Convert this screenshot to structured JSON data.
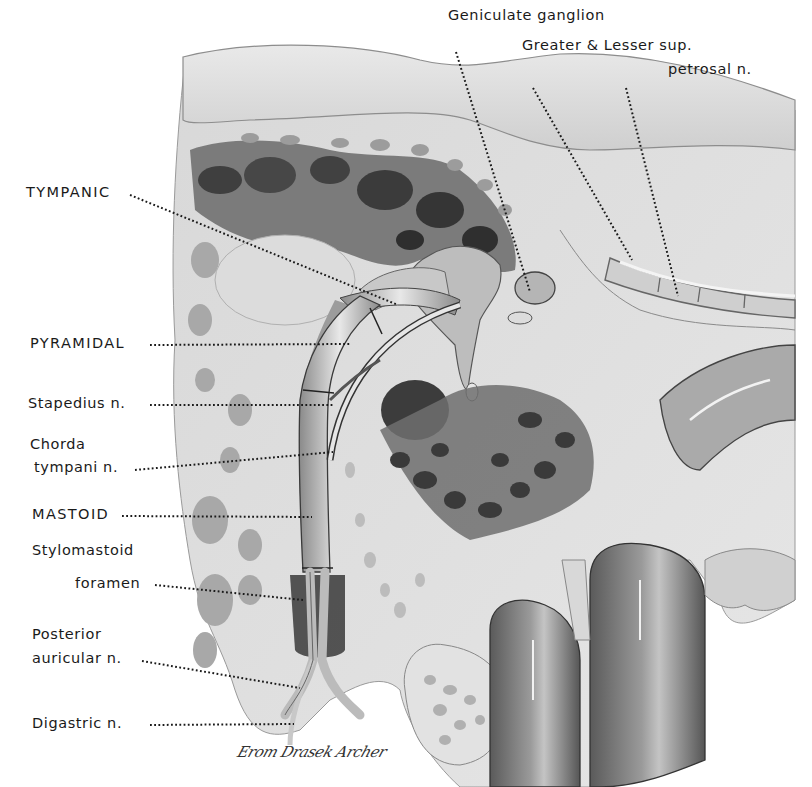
{
  "figure": {
    "type": "anatomical-illustration",
    "colors": {
      "background": "#ffffff",
      "ink": "#1a1a1a",
      "bone_light": "#e4e4e4",
      "bone_mid": "#bdbdbd",
      "cavity_dark": "#5a5a5a",
      "nerve": "#d6d6d6"
    }
  },
  "labels": {
    "geniculate": "Geniculate ganglion",
    "greater_lesser_1": "Greater & Lesser sup.",
    "greater_lesser_2": "petrosal n.",
    "tympanic": "TYMPANIC",
    "pyramidal": "PYRAMIDAL",
    "stapedius": "Stapedius n.",
    "chorda_1": "Chorda",
    "chorda_2": "tympani n.",
    "mastoid": "MASTOID",
    "stylomastoid_1": "Stylomastoid",
    "stylomastoid_2": "foramen",
    "posterior_1": "Posterior",
    "posterior_2": "auricular  n.",
    "digastric": "Digastric  n."
  },
  "signature": "Erom Drasek Archer"
}
